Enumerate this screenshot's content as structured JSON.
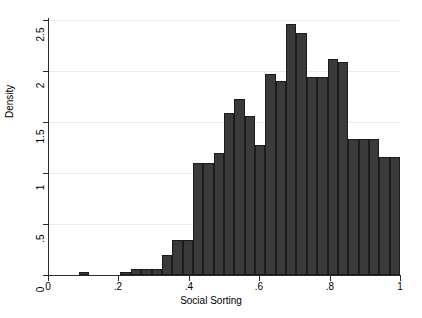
{
  "chart_data": {
    "type": "bar",
    "title": "",
    "xlabel": "Social Sorting",
    "ylabel": "Density",
    "xlim": [
      0,
      1
    ],
    "ylim": [
      0,
      2.5
    ],
    "xticks": [
      "0",
      ".2",
      ".4",
      ".6",
      ".8",
      "1"
    ],
    "xtick_values": [
      0,
      0.2,
      0.4,
      0.6,
      0.8,
      1
    ],
    "yticks": [
      "0",
      ".5",
      "1",
      "1.5",
      "2",
      "2.5"
    ],
    "ytick_values": [
      0,
      0.5,
      1,
      1.5,
      2,
      2.5
    ],
    "grid": true,
    "legend": "none",
    "bin_width": 0.0294,
    "bar_color": "#3a3a3a",
    "bar_edge_color": "#1c1c1c",
    "background_color": "#ffffff",
    "gridline_color": "#ececec",
    "axis_color": "#2b2b2b",
    "bins": [
      {
        "x0": 0.0,
        "x1": 0.0294,
        "value": 0.0
      },
      {
        "x0": 0.0294,
        "x1": 0.0588,
        "value": 0.0
      },
      {
        "x0": 0.0588,
        "x1": 0.0882,
        "value": 0.0
      },
      {
        "x0": 0.0882,
        "x1": 0.1176,
        "value": 0.03
      },
      {
        "x0": 0.1176,
        "x1": 0.1471,
        "value": 0.0
      },
      {
        "x0": 0.1471,
        "x1": 0.1765,
        "value": 0.0
      },
      {
        "x0": 0.1765,
        "x1": 0.2059,
        "value": 0.0
      },
      {
        "x0": 0.2059,
        "x1": 0.2353,
        "value": 0.03
      },
      {
        "x0": 0.2353,
        "x1": 0.2647,
        "value": 0.06
      },
      {
        "x0": 0.2647,
        "x1": 0.2941,
        "value": 0.06
      },
      {
        "x0": 0.2941,
        "x1": 0.3235,
        "value": 0.06
      },
      {
        "x0": 0.3235,
        "x1": 0.3529,
        "value": 0.2
      },
      {
        "x0": 0.3529,
        "x1": 0.3824,
        "value": 0.34
      },
      {
        "x0": 0.3824,
        "x1": 0.4118,
        "value": 0.34
      },
      {
        "x0": 0.4118,
        "x1": 0.4412,
        "value": 1.1
      },
      {
        "x0": 0.4412,
        "x1": 0.4706,
        "value": 1.1
      },
      {
        "x0": 0.4706,
        "x1": 0.5,
        "value": 1.2
      },
      {
        "x0": 0.5,
        "x1": 0.5294,
        "value": 1.59
      },
      {
        "x0": 0.5294,
        "x1": 0.5588,
        "value": 1.73
      },
      {
        "x0": 0.5588,
        "x1": 0.5882,
        "value": 1.56
      },
      {
        "x0": 0.5882,
        "x1": 0.6176,
        "value": 1.27
      },
      {
        "x0": 0.6176,
        "x1": 0.6471,
        "value": 1.97
      },
      {
        "x0": 0.6471,
        "x1": 0.6765,
        "value": 1.9
      },
      {
        "x0": 0.6765,
        "x1": 0.7059,
        "value": 2.46
      },
      {
        "x0": 0.7059,
        "x1": 0.7353,
        "value": 2.37
      },
      {
        "x0": 0.7353,
        "x1": 0.7647,
        "value": 1.94
      },
      {
        "x0": 0.7647,
        "x1": 0.7941,
        "value": 1.94
      },
      {
        "x0": 0.7941,
        "x1": 0.8235,
        "value": 2.12
      },
      {
        "x0": 0.8235,
        "x1": 0.8529,
        "value": 2.09
      },
      {
        "x0": 0.8529,
        "x1": 0.8824,
        "value": 1.33
      },
      {
        "x0": 0.8824,
        "x1": 0.9118,
        "value": 1.33
      },
      {
        "x0": 0.9118,
        "x1": 0.9412,
        "value": 1.33
      },
      {
        "x0": 0.9412,
        "x1": 0.9706,
        "value": 1.16
      },
      {
        "x0": 0.9706,
        "x1": 1.0,
        "value": 1.16
      }
    ]
  }
}
